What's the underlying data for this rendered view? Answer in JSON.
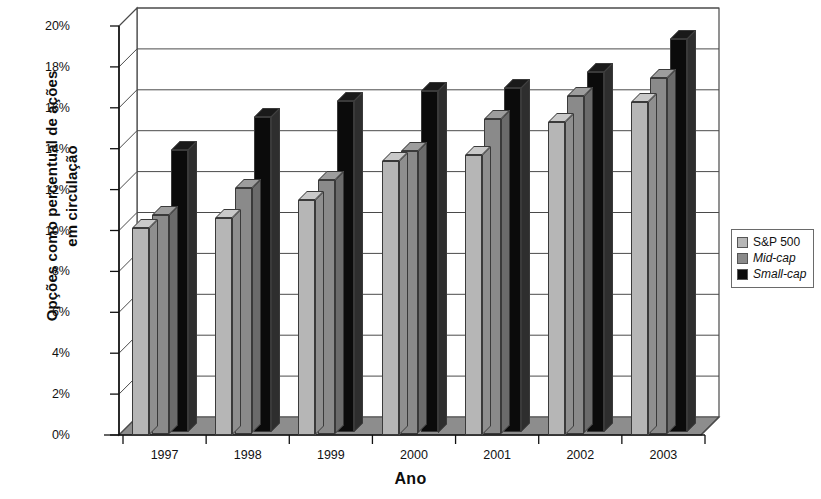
{
  "chart_data": {
    "type": "bar",
    "title": "",
    "xlabel": "Ano",
    "ylabel": "Opções como percentual de ações em circulação",
    "ylabel_line1": "Opções como percentual de ações",
    "ylabel_line2": "em circulação",
    "categories": [
      "1997",
      "1998",
      "1999",
      "2000",
      "2001",
      "2002",
      "2003"
    ],
    "series": [
      {
        "name": "S&P 500",
        "values": [
          10.1,
          10.6,
          11.5,
          13.4,
          13.7,
          15.3,
          16.3
        ],
        "color": "#b6b6b6",
        "italic": false
      },
      {
        "name": "Mid-cap",
        "values": [
          10.7,
          12.0,
          12.4,
          13.8,
          15.4,
          16.5,
          17.4
        ],
        "color": "#8a8a8a",
        "italic": true
      },
      {
        "name": "Small-cap",
        "values": [
          13.8,
          15.4,
          16.2,
          16.7,
          16.8,
          17.6,
          19.2
        ],
        "color": "#0b0b0b",
        "italic": true
      }
    ],
    "yticks": [
      "0%",
      "2%",
      "4%",
      "6%",
      "8%",
      "10%",
      "12%",
      "14%",
      "16%",
      "18%",
      "20%"
    ],
    "ytick_values": [
      0,
      2,
      4,
      6,
      8,
      10,
      12,
      14,
      16,
      18,
      20
    ],
    "ylim": [
      0,
      20
    ],
    "ytick_suffix": "%",
    "grid": true,
    "legend_position": "right",
    "three_d": true
  }
}
